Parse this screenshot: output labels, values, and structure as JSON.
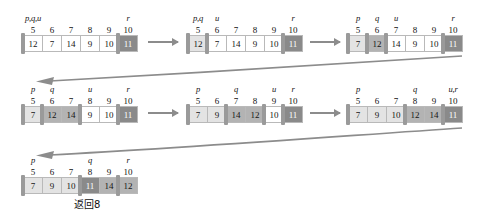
{
  "figure": {
    "caption": "返回8",
    "colors": {
      "cell_white": "#ffffff",
      "cell_light": "#e3e3e3",
      "cell_mid": "#b3b3b3",
      "cell_dark": "#8a8a8a",
      "border": "#b9b9b9",
      "pointer_bar": "#9a9a9a",
      "arrow": "#8c8c8c"
    }
  },
  "arrays": [
    {
      "id": "array-1",
      "indices": [
        "5",
        "6",
        "7",
        "8",
        "9",
        "10"
      ],
      "values": [
        "12",
        "7",
        "14",
        "9",
        "10",
        "11"
      ],
      "tones": [
        "white",
        "white",
        "white",
        "white",
        "white",
        "dark"
      ],
      "pointers": [
        {
          "label": "p,q,u",
          "at_index": 0,
          "side": "left"
        },
        {
          "label": "r",
          "at_index": 5,
          "side": "left"
        }
      ]
    },
    {
      "id": "array-2",
      "indices": [
        "5",
        "6",
        "7",
        "8",
        "9",
        "10"
      ],
      "values": [
        "12",
        "7",
        "14",
        "9",
        "10",
        "11"
      ],
      "tones": [
        "light",
        "white",
        "white",
        "white",
        "white",
        "dark"
      ],
      "pointers": [
        {
          "label": "p,q",
          "at_index": 0,
          "side": "left"
        },
        {
          "label": "u",
          "at_index": 1,
          "side": "left"
        },
        {
          "label": "r",
          "at_index": 5,
          "side": "left"
        }
      ]
    },
    {
      "id": "array-3",
      "indices": [
        "5",
        "6",
        "7",
        "8",
        "9",
        "10"
      ],
      "values": [
        "7",
        "12",
        "14",
        "9",
        "10",
        "11"
      ],
      "tones": [
        "light",
        "mid",
        "white",
        "white",
        "white",
        "dark"
      ],
      "pointers": [
        {
          "label": "p",
          "at_index": 0,
          "side": "left"
        },
        {
          "label": "q",
          "at_index": 1,
          "side": "left"
        },
        {
          "label": "u",
          "at_index": 2,
          "side": "left"
        },
        {
          "label": "r",
          "at_index": 5,
          "side": "left"
        }
      ]
    },
    {
      "id": "array-4",
      "indices": [
        "5",
        "6",
        "7",
        "8",
        "9",
        "10"
      ],
      "values": [
        "7",
        "12",
        "14",
        "9",
        "10",
        "11"
      ],
      "tones": [
        "light",
        "mid",
        "mid",
        "white",
        "white",
        "dark"
      ],
      "pointers": [
        {
          "label": "p",
          "at_index": 0,
          "side": "left"
        },
        {
          "label": "q",
          "at_index": 1,
          "side": "left"
        },
        {
          "label": "u",
          "at_index": 3,
          "side": "left"
        },
        {
          "label": "r",
          "at_index": 5,
          "side": "left"
        }
      ]
    },
    {
      "id": "array-5",
      "indices": [
        "5",
        "6",
        "7",
        "8",
        "9",
        "10"
      ],
      "values": [
        "7",
        "9",
        "14",
        "12",
        "10",
        "11"
      ],
      "tones": [
        "light",
        "light",
        "mid",
        "mid",
        "white",
        "dark"
      ],
      "pointers": [
        {
          "label": "p",
          "at_index": 0,
          "side": "left"
        },
        {
          "label": "q",
          "at_index": 2,
          "side": "left"
        },
        {
          "label": "u",
          "at_index": 4,
          "side": "left"
        },
        {
          "label": "r",
          "at_index": 5,
          "side": "left"
        }
      ]
    },
    {
      "id": "array-6",
      "indices": [
        "5",
        "6",
        "7",
        "8",
        "9",
        "10"
      ],
      "values": [
        "7",
        "9",
        "10",
        "12",
        "14",
        "11"
      ],
      "tones": [
        "light",
        "light",
        "light",
        "mid",
        "mid",
        "dark"
      ],
      "pointers": [
        {
          "label": "p",
          "at_index": 0,
          "side": "left"
        },
        {
          "label": "q",
          "at_index": 3,
          "side": "left"
        },
        {
          "label": "u,r",
          "at_index": 5,
          "side": "left"
        }
      ]
    },
    {
      "id": "array-7",
      "indices": [
        "5",
        "6",
        "7",
        "8",
        "9",
        "10"
      ],
      "values": [
        "7",
        "9",
        "10",
        "11",
        "14",
        "12"
      ],
      "tones": [
        "light",
        "light",
        "light",
        "dark",
        "mid",
        "mid"
      ],
      "pointers": [
        {
          "label": "p",
          "at_index": 0,
          "side": "left"
        },
        {
          "label": "q",
          "at_index": 3,
          "side": "left"
        },
        {
          "label": "r",
          "at_index": 5,
          "side": "left"
        }
      ]
    }
  ],
  "arrows": {
    "straight": [
      {
        "id": "arrow-1-to-2"
      },
      {
        "id": "arrow-2-to-3"
      },
      {
        "id": "arrow-4-to-5"
      },
      {
        "id": "arrow-5-to-6"
      }
    ],
    "curved": [
      {
        "id": "arrow-row1-to-row2"
      },
      {
        "id": "arrow-row2-to-row3"
      }
    ]
  }
}
